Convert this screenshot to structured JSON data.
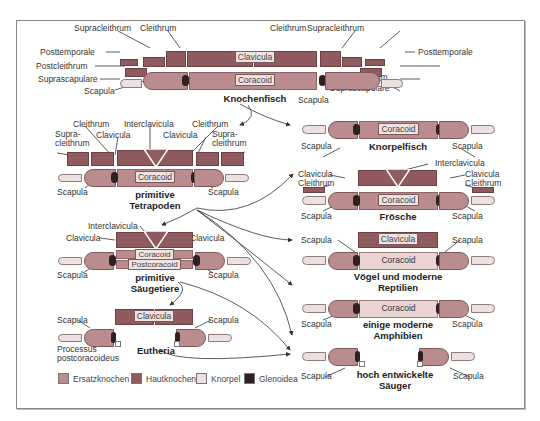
{
  "diagram": {
    "groups": {
      "knochenfisch": {
        "title": "Knochenfisch",
        "labels": {
          "supracleithrum_l": "Supracleithrum",
          "cleithrum_l": "Cleithrum",
          "cleithrum_r": "Cleithrum",
          "supracleithrum_r": "Supracleithrum",
          "posttemporale_l": "Posttemporale",
          "posttemporale_r": "Posttemporale",
          "postcleithrum_l": "Postcleithrum",
          "postcleithrum_r": "Postcleithrum",
          "suprascapulare_l": "Suprascapulare",
          "suprascapulare_r": "Suprascapulare",
          "scapula_l": "Scapula",
          "scapula_r": "Scapula",
          "clavicula": "Clavicula",
          "coracoid": "Coracoid"
        }
      },
      "knorpelfisch": {
        "title": "Knorpelfisch",
        "labels": {
          "coracoid": "Coracoid",
          "scapula_l": "Scapula",
          "scapula_r": "Scapula"
        }
      },
      "primitive_tetrapoden": {
        "title_line1": "primitive",
        "title_line2": "Tetrapoden",
        "labels": {
          "cleithrum_l": "Cleithrum",
          "interclavicula": "Interclavicula",
          "cleithrum_r": "Cleithrum",
          "supracleithrum_l_1": "Supra-",
          "supracleithrum_l_2": "cleithrum",
          "clavicula_l": "Clavicula",
          "clavicula_r": "Clavicula",
          "supracleithrum_r_1": "Supra-",
          "supracleithrum_r_2": "cleithrum",
          "coracoid": "Coracoid",
          "scapula_l": "Scapula",
          "scapula_r": "Scapula"
        }
      },
      "froesche": {
        "title": "Frösche",
        "labels": {
          "interclavicula": "Interclavicula",
          "clavicula_l": "Clavicula",
          "cleithrum_l": "Cleithrum",
          "clavicula_r": "Clavicula",
          "cleithrum_r": "Cleithrum",
          "coracoid": "Coracoid",
          "scapula_l": "Scapula",
          "scapula_r": "Scapula"
        }
      },
      "primitive_saeugetiere": {
        "title_line1": "primitive",
        "title_line2": "Säugetiere",
        "labels": {
          "interclavicula": "Interclavicula",
          "clavicula_l": "Clavicula",
          "clavicula_r": "Clavicula",
          "coracoid": "Coracoid",
          "postcoracoid": "Postcoracoid",
          "scapula_l": "Scapula",
          "scapula_r": "Scapula"
        }
      },
      "voegel": {
        "title_line1": "Vögel und moderne",
        "title_line2": "Reptilien",
        "labels": {
          "clavicula": "Clavicula",
          "coracoid": "Coracoid",
          "scapula_l": "Scapula",
          "scapula_r": "Scapula"
        }
      },
      "amphibien": {
        "title_line1": "einige moderne",
        "title_line2": "Amphibien",
        "labels": {
          "coracoid": "Coracoid",
          "scapula_l": "Scapula",
          "scapula_r": "Scapula"
        }
      },
      "eutheria": {
        "title": "Eutheria",
        "labels": {
          "clavicula": "Clavicula",
          "scapula_l": "Scapula",
          "scapula_r": "Scapula",
          "processus_1": "Processus",
          "processus_2": "postcoracoideus"
        }
      },
      "hoch_saeuger": {
        "title_line1": "hoch entwickelte",
        "title_line2": "Säuger",
        "labels": {
          "scapula_l": "Scapula",
          "scapula_r": "Scapula"
        }
      }
    },
    "legend": [
      {
        "label": "Ersatzknochen",
        "color": "#bb8c8e"
      },
      {
        "label": "Hautknochen",
        "color": "#8f5b5e"
      },
      {
        "label": "Knorpel",
        "color": "#ece0e0"
      },
      {
        "label": "Glenoidea",
        "color": "#2e1f20"
      }
    ],
    "colors": {
      "hautknochen": "#8f5b5e",
      "ersatzknochen": "#bb8c8e",
      "knorpel": "#ece0e0",
      "glenoidea": "#2e1f20",
      "frame": "#8a8a8a"
    }
  }
}
